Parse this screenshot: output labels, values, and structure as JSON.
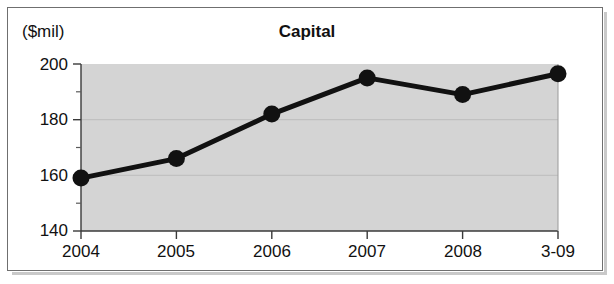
{
  "figure": {
    "y_axis_unit_label": "($mil)",
    "title": "Capital"
  },
  "chart_data": {
    "type": "line",
    "title": "Capital",
    "xlabel": "",
    "ylabel": "($mil)",
    "categories": [
      "2004",
      "2005",
      "2006",
      "2007",
      "2008",
      "3-09"
    ],
    "values": [
      159,
      166,
      182,
      195,
      189,
      196.5
    ],
    "series": [
      {
        "name": "Capital",
        "values": [
          159,
          166,
          182,
          195,
          189,
          196.5
        ]
      }
    ],
    "ylim": [
      140,
      200
    ],
    "y_major_ticks": [
      140,
      160,
      180,
      200
    ],
    "y_minor_ticks": [
      150,
      170,
      190
    ],
    "y_tick_labels": [
      "140",
      "160",
      "180",
      "200"
    ],
    "x_tick_labels": [
      "2004",
      "2005",
      "2006",
      "2007",
      "2008",
      "3-09"
    ],
    "grid": true,
    "legend": false,
    "legend_position": "none",
    "colors": {
      "line": "#111111",
      "marker": "#111111",
      "plot_background": "#d4d4d4",
      "frame": "#6f6f6f",
      "text": "#111111"
    }
  },
  "ticks": {
    "y": [
      {
        "label": "200"
      },
      {
        "label": "180"
      },
      {
        "label": "160"
      },
      {
        "label": "140"
      }
    ],
    "x": [
      {
        "label": "2004"
      },
      {
        "label": "2005"
      },
      {
        "label": "2006"
      },
      {
        "label": "2007"
      },
      {
        "label": "2008"
      },
      {
        "label": "3-09"
      }
    ]
  }
}
